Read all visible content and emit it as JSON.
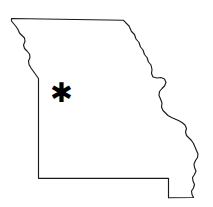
{
  "figure": {
    "background_color": "#ffffff",
    "width": 213,
    "height": 207
  },
  "map": {
    "region_name": "Missouri",
    "outline_color": "#1a1a1a",
    "outline_width": 1.15,
    "fill_color": "none",
    "borders": [
      {
        "name": "northern-border",
        "style": "straight",
        "description": "Iowa state line, straight survey line across the top"
      },
      {
        "name": "northwestern-border",
        "style": "jagged",
        "description": "Missouri River boundary with Nebraska and Kansas"
      },
      {
        "name": "western-border",
        "style": "straight",
        "description": "Kansas state line, straight meridian"
      },
      {
        "name": "southern-border",
        "style": "straight",
        "description": "Arkansas state line with bootheel step"
      },
      {
        "name": "eastern-border",
        "style": "jagged",
        "description": "Mississippi River boundary with Illinois, Kentucky and Tennessee"
      }
    ]
  },
  "markers": [
    {
      "id": "location-marker",
      "glyph": "✱",
      "glyph_name": "asterisk",
      "color": "#000000",
      "x": 61.5,
      "y": 94,
      "size": 27,
      "label": ""
    }
  ]
}
